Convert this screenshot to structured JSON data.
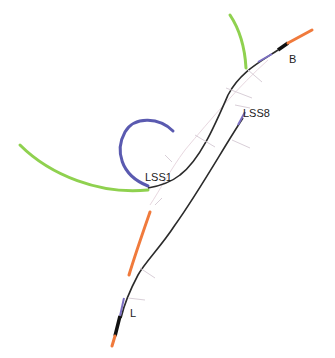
{
  "diagram": {
    "type": "track-layout",
    "labels": [
      {
        "id": "B",
        "text": "B",
        "x": 289,
        "y": 53
      },
      {
        "id": "LSS8",
        "text": "LSS8",
        "x": 243,
        "y": 107
      },
      {
        "id": "LSS1",
        "text": "LSS1",
        "x": 145,
        "y": 171
      },
      {
        "id": "L",
        "text": "L",
        "x": 130,
        "y": 307
      }
    ],
    "colors": {
      "track": "#2b2b2b",
      "green_arc": "#8fd14f",
      "blue_arc": "#5a5ab0",
      "orange": "#f07a3c",
      "purple_segment": "#7b6fc2",
      "faint_marks": "#d9cfd8"
    }
  }
}
